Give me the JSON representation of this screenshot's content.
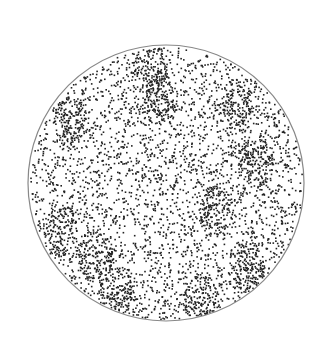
{
  "figure": {
    "shape": "circle",
    "center": [
      166,
      183
    ],
    "radius": 138,
    "outline_color": "#888888",
    "dot_color": "#222222",
    "background": "#ffffff",
    "dot_count": 3200,
    "clusters": [
      [
        70,
        120
      ],
      [
        160,
        100
      ],
      [
        235,
        105
      ],
      [
        215,
        210
      ],
      [
        60,
        230
      ],
      [
        95,
        255
      ],
      [
        245,
        265
      ],
      [
        115,
        290
      ],
      [
        200,
        300
      ],
      [
        150,
        70
      ],
      [
        255,
        160
      ]
    ]
  }
}
